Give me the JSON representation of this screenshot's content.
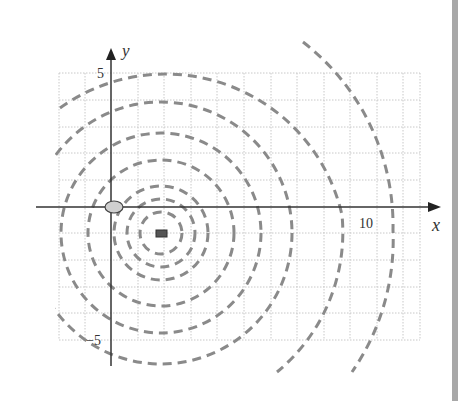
{
  "axes": {
    "x_label": "x",
    "y_label": "y",
    "x_tick_label": "10",
    "y_tick_top": "5",
    "y_tick_bottom": "−5"
  },
  "colors": {
    "wave": "#8a8a8a",
    "axis": "#333333",
    "grid": "#c8c8c8",
    "source": "#444444",
    "object_fill": "#cfcfcf"
  },
  "diagram": {
    "source_position": [
      2,
      -1
    ],
    "object_position": [
      0,
      0
    ],
    "x_range": [
      -2,
      12
    ],
    "y_range": [
      -5,
      5
    ],
    "wavefront_radii_units": [
      0.8,
      1.3,
      1.8,
      2.75,
      3.75,
      4.9,
      6.8,
      8.7
    ]
  }
}
